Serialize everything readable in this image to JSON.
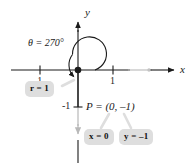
{
  "figure": {
    "type": "coordinate-plane-diagram",
    "background_color": "#ffffff",
    "axis_dark_color": "#1a1a1a",
    "axis_light_color": "#b3b3b3",
    "callout_fill": "#dedede",
    "callout_text_color": "#111111"
  },
  "axes": {
    "x_label": "x",
    "y_label": "y",
    "x_ticks": [
      {
        "label": "-1",
        "value": -1
      },
      {
        "label": "1",
        "value": 1
      }
    ],
    "y_ticks": [
      {
        "label": "-1",
        "value": -1
      }
    ]
  },
  "angle": {
    "label": "θ = 270°",
    "degrees": 270,
    "direction": "counterclockwise"
  },
  "point": {
    "label": "P = (0, –1)",
    "x": 0,
    "y": -1
  },
  "callouts": [
    {
      "name": "radius",
      "label": "r = 1"
    },
    {
      "name": "x-coordinate",
      "label": "x = 0"
    },
    {
      "name": "y-coordinate",
      "label": "y = –1"
    }
  ]
}
